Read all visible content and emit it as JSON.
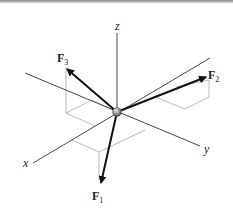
{
  "diagram": {
    "type": "3D force vector diagram",
    "axes": [
      {
        "name": "x",
        "label": "x"
      },
      {
        "name": "y",
        "label": "y"
      },
      {
        "name": "z",
        "label": "z"
      }
    ],
    "forces": [
      {
        "name": "F1",
        "label": "F",
        "subscript": "1"
      },
      {
        "name": "F2",
        "label": "F",
        "subscript": "2"
      },
      {
        "name": "F3",
        "label": "F",
        "subscript": "3"
      }
    ],
    "origin": "particle"
  },
  "colors": {
    "axis": "#333333",
    "arrow": "#111111",
    "guide": "#9a9a9a",
    "particle": "#8c8c8c"
  }
}
